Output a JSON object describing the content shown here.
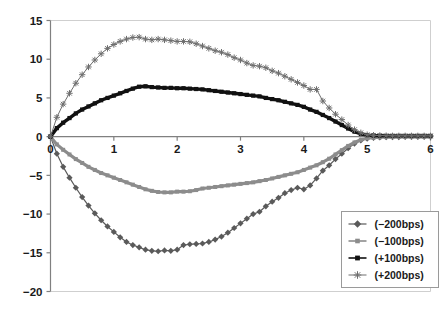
{
  "chart_data": {
    "type": "line",
    "title": "",
    "subtitle": "",
    "xlabel": "",
    "ylabel": "",
    "xlim": [
      0,
      6
    ],
    "ylim": [
      -20,
      15
    ],
    "xticks": [
      0,
      1,
      2,
      3,
      4,
      5,
      6
    ],
    "yticks": [
      15,
      10,
      5,
      0,
      -5,
      -10,
      -15,
      -20
    ],
    "xtick_labels": [
      "0",
      "1",
      "2",
      "3",
      "4",
      "5",
      "6"
    ],
    "ytick_labels": [
      "15",
      "10",
      "5",
      "0",
      "−5",
      "−10",
      "−15",
      "−20"
    ],
    "grid": false,
    "zero_line": true,
    "legend_position": "lower right",
    "legend_border": true,
    "x": [
      0,
      0.1,
      0.2,
      0.3,
      0.4,
      0.5,
      0.6,
      0.7,
      0.8,
      0.9,
      1.0,
      1.1,
      1.2,
      1.3,
      1.4,
      1.5,
      1.6,
      1.7,
      1.8,
      1.9,
      2.0,
      2.1,
      2.2,
      2.3,
      2.4,
      2.5,
      2.6,
      2.7,
      2.8,
      2.9,
      3.0,
      3.1,
      3.2,
      3.3,
      3.4,
      3.5,
      3.6,
      3.7,
      3.8,
      3.9,
      4.0,
      4.1,
      4.2,
      4.3,
      4.4,
      4.5,
      4.6,
      4.7,
      4.8,
      4.9,
      5.0,
      5.1,
      5.2,
      5.3,
      5.4,
      5.5,
      5.6,
      5.7,
      5.8,
      5.9,
      6.0
    ],
    "series": [
      {
        "name": "(−200bps)",
        "key": "minus200",
        "color": "#5a5a5a",
        "marker": "diamond",
        "line_width": 1.2,
        "marker_size": 3.1,
        "values": [
          0.0,
          -2.2,
          -3.9,
          -5.3,
          -6.6,
          -7.8,
          -8.9,
          -9.9,
          -10.8,
          -11.6,
          -12.3,
          -13.0,
          -13.6,
          -14.0,
          -14.3,
          -14.6,
          -14.75,
          -14.8,
          -14.7,
          -14.75,
          -14.6,
          -14.0,
          -13.9,
          -13.85,
          -13.8,
          -13.6,
          -13.3,
          -12.9,
          -12.4,
          -11.8,
          -11.2,
          -10.6,
          -10.0,
          -9.7,
          -9.0,
          -8.4,
          -7.9,
          -7.3,
          -6.9,
          -6.6,
          -6.8,
          -6.3,
          -5.4,
          -4.4,
          -3.7,
          -2.9,
          -2.2,
          -1.5,
          -0.9,
          -0.5,
          -0.25,
          -0.15,
          -0.1,
          -0.08,
          -0.06,
          -0.05,
          -0.04,
          -0.03,
          -0.03,
          -0.02,
          -0.02
        ]
      },
      {
        "name": "(−100bps)",
        "key": "minus100",
        "color": "#8c8c8c",
        "marker": "square",
        "line_width": 3.2,
        "marker_size": 4.0,
        "values": [
          0.0,
          -1.0,
          -1.7,
          -2.3,
          -2.9,
          -3.4,
          -3.9,
          -4.3,
          -4.7,
          -5.0,
          -5.3,
          -5.6,
          -5.9,
          -6.2,
          -6.5,
          -6.8,
          -7.0,
          -7.15,
          -7.2,
          -7.2,
          -7.1,
          -7.1,
          -7.05,
          -6.9,
          -6.7,
          -6.6,
          -6.5,
          -6.4,
          -6.3,
          -6.2,
          -6.1,
          -6.0,
          -5.9,
          -5.75,
          -5.6,
          -5.4,
          -5.2,
          -5.0,
          -4.8,
          -4.6,
          -4.3,
          -4.0,
          -3.7,
          -3.3,
          -2.85,
          -2.3,
          -1.75,
          -1.2,
          -0.75,
          -0.4,
          -0.2,
          -0.12,
          -0.08,
          -0.06,
          -0.05,
          -0.04,
          -0.03,
          -0.03,
          -0.02,
          -0.02,
          -0.02
        ]
      },
      {
        "name": "(+100bps)",
        "key": "plus100",
        "color": "#111111",
        "marker": "square",
        "line_width": 3.4,
        "marker_size": 4.2,
        "values": [
          0.0,
          1.1,
          1.8,
          2.4,
          3.0,
          3.5,
          3.9,
          4.3,
          4.7,
          5.0,
          5.3,
          5.6,
          5.9,
          6.2,
          6.45,
          6.5,
          6.4,
          6.35,
          6.3,
          6.3,
          6.25,
          6.25,
          6.2,
          6.15,
          6.1,
          6.0,
          5.9,
          5.8,
          5.7,
          5.6,
          5.5,
          5.4,
          5.3,
          5.2,
          5.0,
          4.85,
          4.7,
          4.5,
          4.3,
          4.1,
          3.85,
          3.5,
          3.2,
          2.8,
          2.4,
          1.95,
          1.5,
          1.05,
          0.65,
          0.35,
          0.2,
          0.15,
          0.12,
          0.1,
          0.1,
          0.1,
          0.1,
          0.1,
          0.1,
          0.1,
          0.1
        ]
      },
      {
        "name": "(+200bps)",
        "key": "plus200",
        "color": "#6e6e6e",
        "marker": "star",
        "line_width": 1.0,
        "marker_size": 3.2,
        "values": [
          0.0,
          2.5,
          4.2,
          5.6,
          6.9,
          8.0,
          9.0,
          9.9,
          10.7,
          11.4,
          11.9,
          12.3,
          12.6,
          12.8,
          12.85,
          12.6,
          12.5,
          12.6,
          12.5,
          12.4,
          12.3,
          12.3,
          12.25,
          12.0,
          11.7,
          11.4,
          11.1,
          10.9,
          10.6,
          10.2,
          9.9,
          9.5,
          9.2,
          9.1,
          8.9,
          8.5,
          8.2,
          7.8,
          7.4,
          7.0,
          6.6,
          6.1,
          6.1,
          4.6,
          3.7,
          2.9,
          2.2,
          1.5,
          0.9,
          0.5,
          0.25,
          0.18,
          0.15,
          0.12,
          0.1,
          0.1,
          0.1,
          0.1,
          0.1,
          0.1,
          0.1
        ]
      }
    ]
  },
  "legend": {
    "items": [
      {
        "label": "(−200bps)",
        "series_key": "minus200"
      },
      {
        "label": "(−100bps)",
        "series_key": "minus100"
      },
      {
        "label": "(+100bps)",
        "series_key": "plus100"
      },
      {
        "label": "(+200bps)",
        "series_key": "plus200"
      }
    ]
  },
  "style": {
    "background": "#ffffff",
    "plot_border_color": "#cfcfcf",
    "axis_color": "#808080",
    "tick_color": "#808080",
    "text_color": "#1a1a1a",
    "legend_border_color": "#9a9a9a",
    "legend_background": "#ffffff"
  }
}
